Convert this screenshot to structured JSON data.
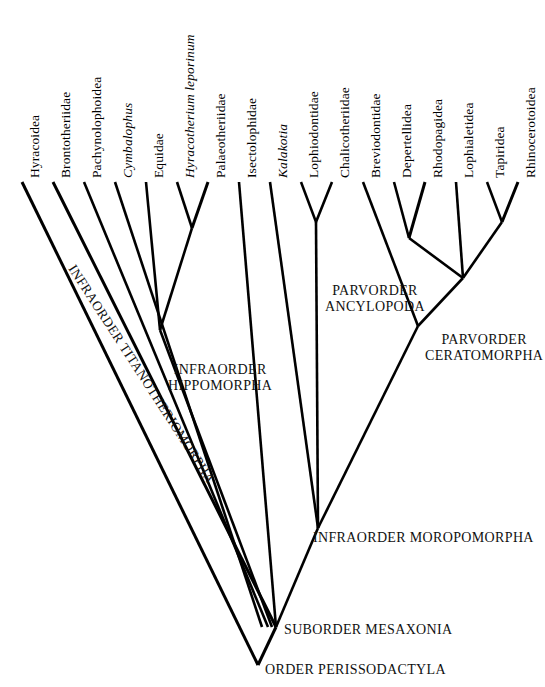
{
  "diagram": {
    "type": "cladogram",
    "line_color": "#000000",
    "background_color": "#ffffff"
  },
  "tips": [
    {
      "id": "hyracoidea",
      "label": "Hyracoidea",
      "italic": false,
      "x": 22,
      "label_x": 22,
      "label_y": 182
    },
    {
      "id": "brontotheriidae",
      "label": "Brontotheriidae",
      "italic": false,
      "x": 53,
      "label_x": 53,
      "label_y": 182
    },
    {
      "id": "pachynolophoidea",
      "label": "Pachynolophoidea",
      "italic": false,
      "x": 84,
      "label_x": 84,
      "label_y": 182
    },
    {
      "id": "cymbalophus",
      "label": "Cymbalophus",
      "italic": true,
      "x": 115,
      "label_x": 115,
      "label_y": 182
    },
    {
      "id": "equidae",
      "label": "Equidae",
      "italic": false,
      "x": 146,
      "label_x": 146,
      "label_y": 182
    },
    {
      "id": "hyracotherium",
      "label": "Hyracotherium  leporinum",
      "italic": true,
      "x": 177,
      "label_x": 177,
      "label_y": 182
    },
    {
      "id": "palaeotheriidae",
      "label": "Palaeotheriidae",
      "italic": false,
      "x": 208,
      "label_x": 208,
      "label_y": 182
    },
    {
      "id": "isectolophidae",
      "label": "Isectolophidae",
      "italic": false,
      "x": 239,
      "label_x": 239,
      "label_y": 182
    },
    {
      "id": "kalakotia",
      "label": "Kalakotia",
      "italic": true,
      "x": 270,
      "label_x": 270,
      "label_y": 182
    },
    {
      "id": "lophiodontidae",
      "label": "Lophiodontidae",
      "italic": false,
      "x": 301,
      "label_x": 301,
      "label_y": 182
    },
    {
      "id": "chalicotheriidae",
      "label": "Chalicotheriidae",
      "italic": false,
      "x": 332,
      "label_x": 332,
      "label_y": 182
    },
    {
      "id": "breviodontidae",
      "label": "Breviodontidae",
      "italic": false,
      "x": 363,
      "label_x": 363,
      "label_y": 182
    },
    {
      "id": "depertellidea",
      "label": "Depertellidea",
      "italic": false,
      "x": 394,
      "label_x": 394,
      "label_y": 182
    },
    {
      "id": "rhodopagidea",
      "label": "Rhodopagidea",
      "italic": false,
      "x": 425,
      "label_x": 425,
      "label_y": 182
    },
    {
      "id": "lophialetidea",
      "label": "Lophialetidea",
      "italic": false,
      "x": 456,
      "label_x": 456,
      "label_y": 182
    },
    {
      "id": "tapiridea",
      "label": "Tapiridea",
      "italic": false,
      "x": 487,
      "label_x": 487,
      "label_y": 182
    },
    {
      "id": "rhinocerotoidea",
      "label": "Rhinocerotoidea",
      "italic": false,
      "x": 518,
      "label_x": 518,
      "label_y": 182
    }
  ],
  "clade_labels": [
    {
      "id": "titanotheriomorpha",
      "line1": "INFRAORDER",
      "line2": "TITANOTHERIOMORPHA",
      "full": "INFRAORDER TITANOTHERIOMORPHA",
      "style": "rotated",
      "x": 78,
      "y": 262,
      "rotation": 57,
      "font_size": 13.5
    },
    {
      "id": "hippomorpha",
      "line1": "INFRAORDER",
      "line2": "HIPPOMORPHA",
      "full": "INFRAORDER HIPPOMORPHA",
      "style": "horizontal",
      "x": 168,
      "y": 362,
      "rotation": 0,
      "font_size": 14
    },
    {
      "id": "ancylopoda",
      "line1": "PARVORDER",
      "line2": "ANCYLOPODA",
      "full": "PARVORDER ANCYLOPODA",
      "style": "horizontal",
      "x": 325,
      "y": 283,
      "rotation": 0,
      "font_size": 14
    },
    {
      "id": "ceratomorpha",
      "line1": "PARVORDER",
      "line2": "CERATOMORPHA",
      "full": "PARVORDER CERATOMORPHA",
      "style": "horizontal",
      "x": 425,
      "y": 332,
      "rotation": 0,
      "font_size": 14
    },
    {
      "id": "moropomorpha",
      "line1": "INFRAORDER MOROPOMORPHA",
      "line2": "",
      "full": "INFRAORDER MOROPOMORPHA",
      "style": "horizontal",
      "x": 313,
      "y": 530,
      "rotation": 0,
      "font_size": 14
    },
    {
      "id": "mesaxonia",
      "line1": "SUBORDER MESAXONIA",
      "line2": "",
      "full": "SUBORDER MESAXONIA",
      "style": "horizontal",
      "x": 284,
      "y": 622,
      "rotation": 0,
      "font_size": 14
    },
    {
      "id": "perissodactyla",
      "line1": "ORDER PERISSODACTYLA",
      "line2": "",
      "full": "ORDER PERISSODACTYLA",
      "style": "horizontal",
      "x": 265,
      "y": 662,
      "rotation": 0,
      "font_size": 14
    }
  ],
  "nodes": [
    {
      "id": "node-hyracotherium-palaeotheriidae",
      "x": 192,
      "y": 228
    },
    {
      "id": "node-equidae-clade",
      "x": 160,
      "y": 330
    },
    {
      "id": "node-ancylopoda",
      "x": 316,
      "y": 222
    },
    {
      "id": "node-depertellidea-rhodopagidea",
      "x": 409,
      "y": 238
    },
    {
      "id": "node-tapiridea-rhinocerotoidea",
      "x": 502,
      "y": 222
    },
    {
      "id": "node-ceratomorpha",
      "x": 463,
      "y": 278
    },
    {
      "id": "node-ceratomorpha-stem",
      "x": 418,
      "y": 326
    },
    {
      "id": "node-moropomorpha",
      "x": 318,
      "y": 528
    },
    {
      "id": "node-mesaxonia",
      "x": 276,
      "y": 627
    },
    {
      "id": "node-perissodactyla-root",
      "x": 258,
      "y": 665
    }
  ],
  "branches": [
    {
      "id": "b-hyracoidea",
      "d": "M22,182 L258,665",
      "w": 3.0
    },
    {
      "id": "b-brontotheriidae",
      "d": "M53,182 L276,627",
      "w": 3.0
    },
    {
      "id": "b-pachynolophoidea",
      "d": "M84,182 L268,627",
      "w": 2.6
    },
    {
      "id": "b-cymbalophus",
      "d": "M115,182 L262,627",
      "w": 2.6
    },
    {
      "id": "b-equidae",
      "d": "M146,182 L160,330",
      "w": 2.6
    },
    {
      "id": "b-hyracotherium",
      "d": "M177,182 L192,228",
      "w": 2.6
    },
    {
      "id": "b-palaeotheriidae",
      "d": "M208,182 L192,228",
      "w": 3.0
    },
    {
      "id": "b-hyrpal-stem",
      "d": "M192,228 L160,330",
      "w": 2.6
    },
    {
      "id": "b-hippomorpha-stem",
      "d": "M160,330 L272,627",
      "w": 2.6
    },
    {
      "id": "b-isectolophidae",
      "d": "M239,182 L276,627",
      "w": 2.6
    },
    {
      "id": "b-kalakotia",
      "d": "M270,182 L318,528",
      "w": 2.6
    },
    {
      "id": "b-lophiodontidae",
      "d": "M301,182 L316,222",
      "w": 2.6
    },
    {
      "id": "b-chalicotheriidae",
      "d": "M332,182 L316,222",
      "w": 2.6
    },
    {
      "id": "b-ancylopoda-stem",
      "d": "M316,222 L318,528",
      "w": 2.6
    },
    {
      "id": "b-breviodontidae",
      "d": "M363,182 L418,326",
      "w": 2.6
    },
    {
      "id": "b-depertellidea",
      "d": "M394,182 L409,238",
      "w": 2.6
    },
    {
      "id": "b-rhodopagidea",
      "d": "M425,182 L409,238",
      "w": 3.0
    },
    {
      "id": "b-deprho-stem",
      "d": "M409,238 L463,278",
      "w": 2.6
    },
    {
      "id": "b-lophialetidea",
      "d": "M456,182 L463,278",
      "w": 2.6
    },
    {
      "id": "b-tapiridea",
      "d": "M487,182 L502,222",
      "w": 2.6
    },
    {
      "id": "b-rhinocerotoidea",
      "d": "M518,182 L502,222",
      "w": 3.0
    },
    {
      "id": "b-taprhi-stem",
      "d": "M502,222 L463,278",
      "w": 2.6
    },
    {
      "id": "b-ceratomorpha-stem",
      "d": "M463,278 L418,326",
      "w": 2.6
    },
    {
      "id": "b-moropomorpha-stem",
      "d": "M418,326 L318,528",
      "w": 2.6
    },
    {
      "id": "b-mesaxonia-stem",
      "d": "M318,528 L276,627",
      "w": 2.6
    },
    {
      "id": "b-root-stem",
      "d": "M276,627 L258,665",
      "w": 3.0
    }
  ]
}
